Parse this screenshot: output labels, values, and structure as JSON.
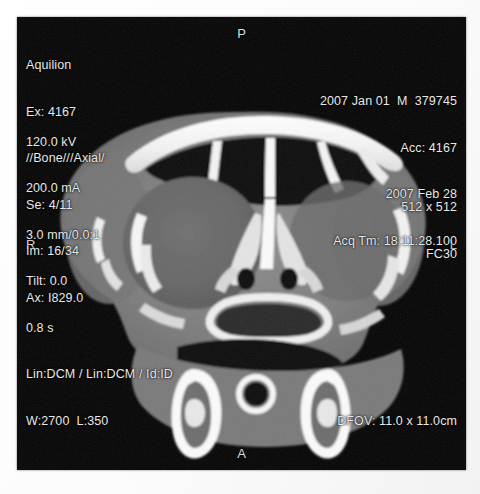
{
  "frame": {
    "background_color": "#050505",
    "paper_color": "#ffffff",
    "text_color": "#e9e9e9"
  },
  "study_info": {
    "scanner": "Aquilion",
    "exam": "Ex: 4167",
    "protocol": "//Bone///Axial/",
    "series": "Se: 4/11",
    "image": "Im: 16/34",
    "axial_position": "Ax: I829.0"
  },
  "patient_info": {
    "date_sex_id": "2007 Jan 01  M  379745",
    "accession": "Acc: 4167",
    "study_date": "2007 Feb 28",
    "acquisition_time": "Acq Tm: 18:11:28.100"
  },
  "detector_info": {
    "matrix": "512 x 512",
    "kernel": "FC30"
  },
  "technique": {
    "kv": "120.0 kV",
    "ma": "200.0 mA",
    "slice": "3.0 mm/0.0:1",
    "tilt": "Tilt: 0.0",
    "exposure_time": "0.8 s",
    "lut": "Lin:DCM / Lin:DCM / Id:ID",
    "window_level": "W:2700  L:350"
  },
  "display_field": {
    "dfov": "DFOV: 11.0 x 11.0cm"
  },
  "orientation": {
    "top": "P",
    "bottom": "A",
    "left": "R",
    "right": "L"
  }
}
